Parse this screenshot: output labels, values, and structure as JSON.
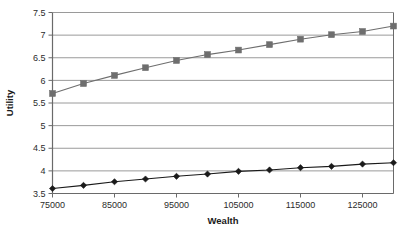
{
  "chart_data": {
    "type": "line",
    "title": "",
    "xlabel": "Wealth",
    "ylabel": "Utility",
    "xlim": [
      75000,
      130000
    ],
    "ylim": [
      3.5,
      7.5
    ],
    "grid": "horizontal",
    "legend": "none",
    "x": [
      75000,
      80000,
      85000,
      90000,
      95000,
      100000,
      105000,
      110000,
      115000,
      120000,
      125000,
      130000
    ],
    "xticks": [
      75000,
      85000,
      95000,
      105000,
      115000,
      125000
    ],
    "xticklabels": [
      "75000",
      "85000",
      "95000",
      "105000",
      "115000",
      "125000"
    ],
    "yticks": [
      3.5,
      4,
      4.5,
      5,
      5.5,
      6,
      6.5,
      7,
      7.5
    ],
    "yticklabels": [
      "3.5",
      "4",
      "4.5",
      "5",
      "5.5",
      "6",
      "6.5",
      "7",
      "7.5"
    ],
    "series": [
      {
        "name": "upper-series",
        "marker": "square",
        "color": "#6e6e6e",
        "line_color": "#6e6e6e",
        "values": [
          5.71,
          5.93,
          6.11,
          6.28,
          6.44,
          6.57,
          6.67,
          6.79,
          6.91,
          7.01,
          7.08,
          7.2
        ]
      },
      {
        "name": "lower-series",
        "marker": "diamond",
        "color": "#1a1a1a",
        "line_color": "#1a1a1a",
        "values": [
          3.61,
          3.68,
          3.76,
          3.82,
          3.88,
          3.93,
          3.99,
          4.02,
          4.07,
          4.1,
          4.15,
          4.18
        ]
      }
    ]
  },
  "style": {
    "grid_color": "#9a9a9a",
    "axis_color": "#6a6a6a",
    "background": "#ffffff"
  }
}
